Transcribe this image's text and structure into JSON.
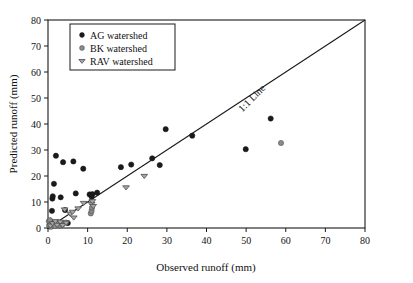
{
  "figure": {
    "background_color": "#ffffff",
    "frame_color": "#1a1a1a"
  },
  "chart_data": {
    "type": "scatter",
    "title": "",
    "xlabel": "Observed runoff (mm)",
    "ylabel": "Predicted runoff (mm)",
    "xlim": [
      0,
      80
    ],
    "ylim": [
      0,
      80
    ],
    "xticks": [
      0,
      10,
      20,
      30,
      40,
      50,
      60,
      70,
      80
    ],
    "yticks": [
      0,
      10,
      20,
      30,
      40,
      50,
      60,
      70,
      80
    ],
    "xtick_labels": [
      "0",
      "10",
      "20",
      "30",
      "40",
      "50",
      "60",
      "70",
      "80"
    ],
    "ytick_labels": [
      "0",
      "10",
      "20",
      "30",
      "40",
      "50",
      "60",
      "70",
      "80"
    ],
    "grid": false,
    "legend_position": "upper-left",
    "annotations": [
      {
        "name": "identity-line-label",
        "text": "1:1 Line",
        "x": 52.0,
        "y": 49.0,
        "rotation_deg": -45
      }
    ],
    "reference_lines": [
      {
        "name": "identity-line",
        "label": "1:1 Line",
        "from": [
          0,
          0
        ],
        "to": [
          80,
          80
        ],
        "color": "#1a1a1a"
      }
    ],
    "series": [
      {
        "name": "AG watershed",
        "marker": "circle",
        "color": "#1a1a1a",
        "edge_color": "#1a1a1a",
        "points": [
          [
            0.4,
            0.6
          ],
          [
            0.6,
            1.4
          ],
          [
            0.9,
            2.2
          ],
          [
            1.0,
            6.6
          ],
          [
            1.1,
            11.3
          ],
          [
            1.2,
            12.2
          ],
          [
            1.5,
            17.0
          ],
          [
            2.0,
            27.8
          ],
          [
            2.2,
            1.5
          ],
          [
            2.6,
            2.0
          ],
          [
            3.2,
            11.8
          ],
          [
            3.8,
            25.3
          ],
          [
            4.3,
            6.9
          ],
          [
            5.0,
            1.9
          ],
          [
            6.4,
            25.6
          ],
          [
            7.0,
            13.3
          ],
          [
            8.9,
            22.8
          ],
          [
            10.5,
            12.9
          ],
          [
            11.0,
            12.1
          ],
          [
            11.2,
            13.0
          ],
          [
            12.4,
            13.6
          ],
          [
            18.4,
            23.4
          ],
          [
            21.0,
            24.4
          ],
          [
            26.3,
            26.8
          ],
          [
            28.2,
            24.2
          ],
          [
            29.7,
            38.0
          ],
          [
            36.4,
            35.5
          ],
          [
            49.9,
            30.3
          ],
          [
            56.2,
            42.1
          ]
        ]
      },
      {
        "name": "BK watershed",
        "marker": "circle",
        "color": "#8c8c8c",
        "edge_color": "#4d4d4d",
        "points": [
          [
            0.2,
            2.6
          ],
          [
            0.3,
            1.0
          ],
          [
            0.5,
            3.0
          ],
          [
            0.8,
            0.5
          ],
          [
            1.3,
            1.1
          ],
          [
            1.8,
            0.8
          ],
          [
            2.4,
            1.6
          ],
          [
            3.0,
            0.9
          ],
          [
            3.6,
            1.3
          ],
          [
            4.5,
            2.1
          ],
          [
            10.8,
            5.6
          ],
          [
            11.0,
            6.6
          ],
          [
            11.1,
            7.8
          ],
          [
            58.8,
            32.7
          ]
        ]
      },
      {
        "name": "RAV watershed",
        "marker": "triangle-down",
        "color": "#a6a6a6",
        "edge_color": "#4d4d4d",
        "points": [
          [
            0.6,
            0.9
          ],
          [
            1.2,
            1.8
          ],
          [
            1.9,
            2.6
          ],
          [
            2.3,
            1.2
          ],
          [
            3.1,
            2.4
          ],
          [
            3.7,
            1.1
          ],
          [
            4.2,
            7.1
          ],
          [
            4.6,
            2.0
          ],
          [
            5.6,
            5.5
          ],
          [
            6.2,
            6.2
          ],
          [
            6.5,
            4.0
          ],
          [
            7.6,
            7.5
          ],
          [
            9.0,
            9.6
          ],
          [
            11.0,
            9.2
          ],
          [
            11.2,
            10.3
          ],
          [
            11.4,
            8.4
          ],
          [
            19.7,
            15.6
          ],
          [
            24.3,
            20.0
          ]
        ]
      }
    ]
  },
  "legend": {
    "entries": [
      {
        "label": "AG watershed",
        "marker": "circle",
        "color": "#1a1a1a"
      },
      {
        "label": "BK watershed",
        "marker": "circle",
        "color": "#8c8c8c"
      },
      {
        "label": "RAV watershed",
        "marker": "triangle-down",
        "color": "#a6a6a6"
      }
    ]
  }
}
